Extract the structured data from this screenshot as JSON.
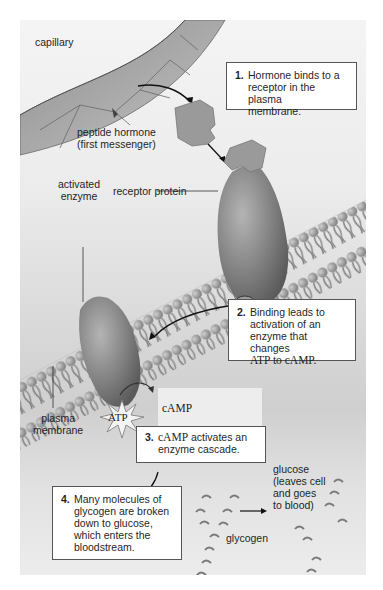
{
  "figure": {
    "labels": {
      "capillary": "capillary",
      "peptide_hormone": "peptide hormone\n(first messenger)",
      "receptor_protein": "receptor protein",
      "activated_enzyme": "activated\nenzyme",
      "plasma_membrane": "plasma\nmembrane",
      "atp": "ATP",
      "camp_line1": "cAMP",
      "camp_line2": "(second messenger)",
      "glucose": "glucose\n(leaves cell\nand goes\nto blood)",
      "glycogen": "glycogen"
    },
    "steps": [
      {
        "num": "1.",
        "text": "Hormone binds to a\nreceptor in the plasma\nmembrane."
      },
      {
        "num": "2.",
        "text_sans": "Binding leads to\nactivation of an\nenzyme that changes",
        "text_serif": "ATP to cAMP."
      },
      {
        "num": "3.",
        "text_serif_prefix": "cAMP",
        "text": " activates an",
        "text2": "enzyme cascade."
      },
      {
        "num": "4.",
        "text": "Many molecules of\nglycogen are broken\ndown to glucose,\nwhich enters the\nbloodstream."
      }
    ],
    "colors": {
      "background": "#ececec",
      "protein": "#8a8a8a",
      "hormone": "#9a9a9a",
      "capillary": "#a8a8a8",
      "box_border": "#555555"
    }
  }
}
